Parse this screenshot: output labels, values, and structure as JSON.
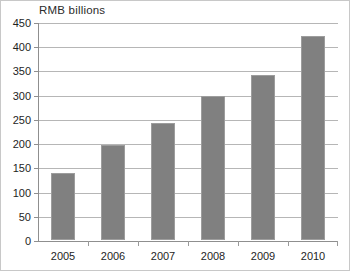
{
  "chart_data": {
    "type": "bar",
    "title": "RMB billions",
    "xlabel": "",
    "ylabel": "",
    "categories": [
      "2005",
      "2006",
      "2007",
      "2008",
      "2009",
      "2010"
    ],
    "values": [
      139,
      196,
      241,
      297,
      340,
      422
    ],
    "ylim": [
      0,
      450
    ],
    "ytick_step": 50,
    "yticks": [
      0,
      50,
      100,
      150,
      200,
      250,
      300,
      350,
      400,
      450
    ],
    "ytick_labels": [
      "0",
      "50",
      "100",
      "150",
      "200",
      "250",
      "300",
      "350",
      "400",
      "450"
    ],
    "grid": true,
    "legend": null,
    "legend_position": "none",
    "series": [
      {
        "name": "RMB billions",
        "values": [
          139,
          196,
          241,
          297,
          340,
          422
        ],
        "color": "#808080"
      }
    ],
    "colors": {
      "bar_fill": "#808080",
      "bar_edge": "#9d9d9d",
      "gridline": "#b6b6b6",
      "axis": "#8f8f8f",
      "text": "#1e1e1e",
      "background": "#ffffff",
      "figure_border": "#c8c8c8"
    }
  }
}
